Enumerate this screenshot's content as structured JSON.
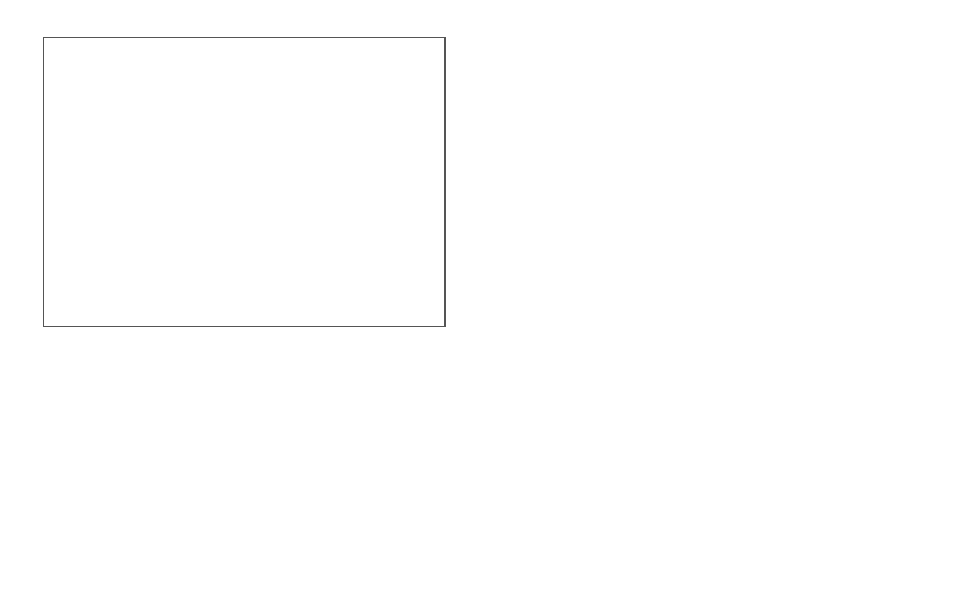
{
  "panel_a": {
    "tag": "A",
    "nodes": {
      "research_study": "research study",
      "study_arm": "study arm\n(a class)",
      "study_arm_l1": "study arm",
      "study_arm_l2": "(a class)",
      "study_subject": "study subject",
      "intervention": "intervention",
      "cohort_description": "cohort description",
      "subject_char_l1": "subject",
      "subject_char_l2": "characteristics",
      "enrollment_l1": "enrollment",
      "enrollment_l2": "status",
      "disease": "disease",
      "monitoring": "monitoring",
      "statistical_measure": "statistical measure",
      "unit": "unit"
    },
    "edges": {
      "has_participant": "has participant",
      "has_attribute_1": "has attribute",
      "has_data_item": "has data item",
      "sub_class_of": "sub-class of",
      "has_property_1": "has property",
      "has_property_2": "has property",
      "has_attribute_2": "has attribute",
      "has_unit": "has unit"
    }
  },
  "panel_b": {
    "tag": "B",
    "nodes": {
      "intervention_arm": "intervention arm",
      "study_subject_l1": "study",
      "study_subject_l2": "subject",
      "stat_measure_l1": "statitiscal",
      "stat_measure_l2": "measure",
      "metformin_l1": "metformin arm (a",
      "metformin_l2": "class)",
      "age": "age",
      "mean": "mean",
      "age_instance": "age instance",
      "mean_instance": "mean instance",
      "value": "66.2"
    },
    "edges": {
      "type_1": "type",
      "sub_class_of_1": "sub-class of",
      "has_attribute_1": "has attribute",
      "sub_class_of_2": "sub-class of",
      "has_attribute_2": "has attribute",
      "type_2": "type",
      "type_3": "type",
      "has_attribute_3": "has attribute",
      "has_value": "has value"
    }
  },
  "legend": {
    "title": "Legend",
    "items": [
      {
        "label_l1": "Class in",
        "label_l2": "Ontology",
        "color": "#5d5d5d"
      },
      {
        "label_l1": "Instances",
        "label_l2": "found in Table 1s",
        "color": "#6e6e6e"
      }
    ]
  },
  "colors": {
    "class_node": "#8f8f8f",
    "light_node": "#a9a9a9",
    "dark_node": "#5d5d5d",
    "border": "#555555"
  }
}
